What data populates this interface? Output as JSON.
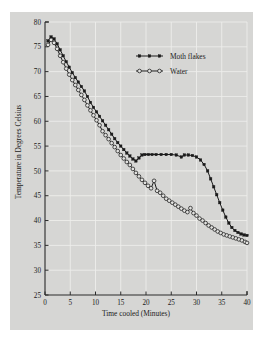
{
  "chart_data": {
    "type": "line",
    "title": "",
    "xlabel": "Time cooled (Minutes)",
    "ylabel": "Temperature in Degrees Celsius",
    "xlim": [
      0,
      40
    ],
    "ylim": [
      25,
      80
    ],
    "xticks": [
      0,
      5,
      10,
      15,
      20,
      25,
      30,
      35,
      40
    ],
    "yticks": [
      25,
      30,
      35,
      40,
      45,
      50,
      55,
      60,
      65,
      70,
      75,
      80
    ],
    "grid": true,
    "legend_position": "upper-center",
    "series": [
      {
        "name": "Moth flakes",
        "marker": "filled-square",
        "color": "#1a1a1a",
        "points": [
          [
            0.6,
            76.2
          ],
          [
            1.2,
            77.0
          ],
          [
            1.8,
            76.6
          ],
          [
            2.4,
            75.6
          ],
          [
            3.0,
            74.4
          ],
          [
            3.6,
            73.2
          ],
          [
            4.2,
            72.0
          ],
          [
            4.8,
            70.9
          ],
          [
            5.4,
            69.8
          ],
          [
            6.0,
            68.8
          ],
          [
            6.6,
            67.9
          ],
          [
            7.2,
            67.0
          ],
          [
            7.8,
            66.1
          ],
          [
            8.4,
            65.0
          ],
          [
            9.0,
            63.8
          ],
          [
            9.6,
            62.8
          ],
          [
            10.2,
            61.9
          ],
          [
            10.8,
            61.0
          ],
          [
            11.4,
            60.1
          ],
          [
            12.0,
            59.2
          ],
          [
            12.6,
            58.3
          ],
          [
            13.2,
            57.4
          ],
          [
            13.8,
            56.5
          ],
          [
            14.4,
            55.7
          ],
          [
            15.0,
            55.0
          ],
          [
            15.6,
            54.3
          ],
          [
            16.2,
            53.6
          ],
          [
            16.8,
            53.0
          ],
          [
            17.4,
            52.4
          ],
          [
            18.0,
            52.0
          ],
          [
            18.6,
            52.6
          ],
          [
            19.2,
            53.2
          ],
          [
            19.8,
            53.3
          ],
          [
            20.5,
            53.3
          ],
          [
            21.2,
            53.3
          ],
          [
            22.0,
            53.3
          ],
          [
            23.0,
            53.3
          ],
          [
            24.0,
            53.3
          ],
          [
            25.0,
            53.3
          ],
          [
            26.0,
            53.2
          ],
          [
            27.0,
            52.8
          ],
          [
            27.6,
            53.2
          ],
          [
            28.4,
            53.2
          ],
          [
            29.2,
            53.1
          ],
          [
            30.0,
            52.8
          ],
          [
            30.8,
            52.2
          ],
          [
            31.5,
            51.3
          ],
          [
            32.2,
            50.0
          ],
          [
            32.8,
            48.4
          ],
          [
            33.4,
            46.8
          ],
          [
            34.0,
            45.2
          ],
          [
            34.6,
            43.6
          ],
          [
            35.2,
            42.1
          ],
          [
            35.8,
            40.7
          ],
          [
            36.4,
            39.5
          ],
          [
            37.0,
            38.6
          ],
          [
            37.6,
            38.0
          ],
          [
            38.2,
            37.6
          ],
          [
            38.8,
            37.3
          ],
          [
            39.4,
            37.1
          ],
          [
            40.0,
            37.0
          ]
        ]
      },
      {
        "name": "Water",
        "marker": "open-circle",
        "color": "#1a1a1a",
        "points": [
          [
            0.6,
            75.4
          ],
          [
            1.2,
            76.4
          ],
          [
            1.8,
            75.8
          ],
          [
            2.4,
            74.6
          ],
          [
            3.0,
            73.2
          ],
          [
            3.6,
            71.9
          ],
          [
            4.2,
            70.6
          ],
          [
            4.8,
            69.4
          ],
          [
            5.4,
            68.3
          ],
          [
            6.0,
            67.3
          ],
          [
            6.6,
            66.3
          ],
          [
            7.2,
            65.3
          ],
          [
            7.8,
            64.3
          ],
          [
            8.4,
            63.2
          ],
          [
            9.0,
            62.2
          ],
          [
            9.6,
            61.2
          ],
          [
            10.2,
            60.2
          ],
          [
            10.8,
            59.2
          ],
          [
            11.4,
            58.0
          ],
          [
            12.0,
            57.2
          ],
          [
            12.6,
            56.4
          ],
          [
            13.2,
            55.6
          ],
          [
            13.8,
            54.8
          ],
          [
            14.4,
            54.0
          ],
          [
            15.0,
            53.2
          ],
          [
            15.6,
            52.5
          ],
          [
            16.2,
            51.8
          ],
          [
            16.8,
            51.2
          ],
          [
            17.4,
            50.4
          ],
          [
            18.0,
            49.6
          ],
          [
            18.6,
            48.9
          ],
          [
            19.2,
            48.2
          ],
          [
            19.8,
            47.6
          ],
          [
            20.4,
            47.0
          ],
          [
            21.0,
            46.5
          ],
          [
            21.6,
            48.0
          ],
          [
            22.2,
            46.0
          ],
          [
            22.8,
            45.6
          ],
          [
            23.4,
            45.0
          ],
          [
            24.0,
            44.4
          ],
          [
            24.6,
            44.0
          ],
          [
            25.2,
            43.6
          ],
          [
            25.8,
            43.2
          ],
          [
            26.4,
            42.8
          ],
          [
            27.0,
            42.4
          ],
          [
            27.6,
            42.0
          ],
          [
            28.2,
            41.7
          ],
          [
            28.8,
            42.5
          ],
          [
            29.4,
            41.5
          ],
          [
            30.0,
            41.0
          ],
          [
            30.6,
            40.4
          ],
          [
            31.2,
            40.0
          ],
          [
            31.8,
            39.5
          ],
          [
            32.4,
            39.0
          ],
          [
            33.0,
            38.6
          ],
          [
            33.6,
            38.2
          ],
          [
            34.2,
            37.8
          ],
          [
            34.8,
            37.5
          ],
          [
            35.4,
            37.2
          ],
          [
            36.0,
            37.0
          ],
          [
            36.6,
            36.8
          ],
          [
            37.2,
            36.6
          ],
          [
            37.8,
            36.4
          ],
          [
            38.4,
            36.2
          ],
          [
            39.0,
            36.0
          ],
          [
            39.6,
            35.7
          ],
          [
            40.0,
            35.5
          ]
        ]
      }
    ],
    "legend": [
      {
        "label": "Moth flakes",
        "marker": "filled-square"
      },
      {
        "label": "Water",
        "marker": "open-circle"
      }
    ]
  }
}
